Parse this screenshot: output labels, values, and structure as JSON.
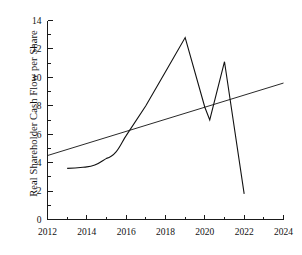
{
  "chart_data": {
    "type": "line",
    "title": "",
    "xlabel": "",
    "ylabel": "Real Shareholder Cash Flow per Share",
    "xlim": [
      2012,
      2024
    ],
    "ylim": [
      0,
      14
    ],
    "grid": false,
    "legend": "none",
    "x_ticks": [
      2012,
      2014,
      2016,
      2018,
      2020,
      2022,
      2024
    ],
    "x_tick_labels": [
      "2012",
      "2014",
      "2016",
      "2018",
      "2020",
      "2022",
      "2024"
    ],
    "x_minor_ticks": [
      2013,
      2015,
      2017,
      2019,
      2021,
      2023
    ],
    "y_ticks": [
      0,
      2,
      4,
      6,
      8,
      10,
      12,
      14
    ],
    "y_tick_labels": [
      "0",
      "2",
      "4",
      "6",
      "8",
      "10",
      "12",
      "14"
    ],
    "y_minor_ticks": [
      1,
      3,
      5,
      7,
      9,
      11,
      13
    ],
    "series": [
      {
        "name": "Real Shareholder Cash Flow per Share",
        "x": [
          2013,
          2014,
          2015,
          2016,
          2017,
          2018,
          2019,
          2020,
          2020.25,
          2021,
          2022
        ],
        "values": [
          3.6,
          3.7,
          4.3,
          5.9,
          8.0,
          10.4,
          12.8,
          7.9,
          7.0,
          11.1,
          1.8
        ]
      },
      {
        "name": "Trend line",
        "x": [
          2012,
          2024
        ],
        "values": [
          4.5,
          9.6
        ]
      }
    ]
  },
  "axes": {
    "y_axis_title": "Real Shareholder Cash Flow per Share"
  },
  "colors": {
    "series": "#111111",
    "trend": "#111111",
    "axis": "#1a1a1a",
    "background": "#ffffff"
  }
}
